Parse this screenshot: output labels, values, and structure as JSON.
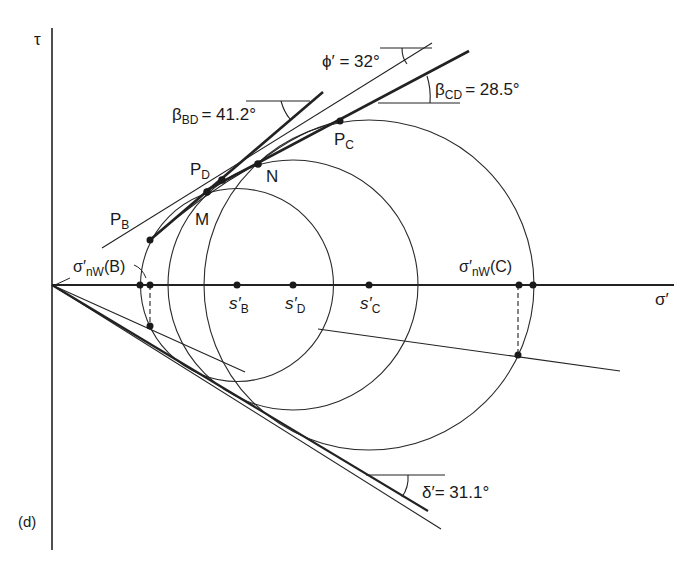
{
  "figure": {
    "panel_label": "(d)",
    "axes": {
      "y_label": "τ",
      "x_label": "σ′"
    },
    "centers": [
      {
        "symbol": "s′",
        "sub": "B",
        "x": 237
      },
      {
        "symbol": "s′",
        "sub": "D",
        "x": 293
      },
      {
        "symbol": "s′",
        "sub": "C",
        "x": 369
      }
    ],
    "points": {
      "PB": {
        "main": "P",
        "sub": "B"
      },
      "PD": {
        "main": "P",
        "sub": "D"
      },
      "PC": {
        "main": "P",
        "sub": "C"
      },
      "M": "M",
      "N": "N"
    },
    "wall_stress": {
      "B": {
        "main": "σ′",
        "sub": "nW",
        "suffix": "(B)"
      },
      "C": {
        "main": "σ′",
        "sub": "nW",
        "suffix": "(C)"
      }
    },
    "angles": {
      "phi": {
        "text": "ϕ′ = 32°",
        "value_deg": 32
      },
      "beta_BD": {
        "main": "β",
        "sub": "BD",
        "value": "= 41.2°",
        "value_deg": 41.2
      },
      "beta_CD": {
        "main": "β",
        "sub": "CD",
        "value": "= 28.5°",
        "value_deg": 28.5
      },
      "delta": {
        "text": "δ′= 31.1°",
        "value_deg": 31.1
      }
    }
  }
}
